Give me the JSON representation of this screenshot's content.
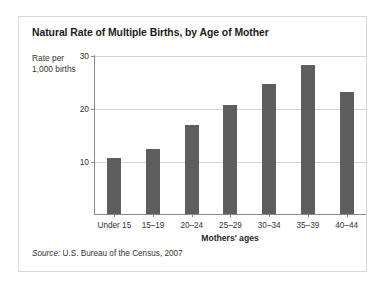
{
  "figure": {
    "title": "Natural Rate of Multiple Births, by Age of Mother",
    "source_prefix": "Source:",
    "source_text": " U.S. Bureau of the Census, 2007",
    "ylabel_line1": "Rate per",
    "ylabel_line2": "1,000 births",
    "xlabel": "Mothers' ages",
    "bar_color": "#5e5e5e",
    "grid_color": "#d5d5d5",
    "axis_color": "#8a8a8a",
    "frame_color": "#d8d8d8"
  },
  "chart_data": {
    "type": "bar",
    "title": "Natural Rate of Multiple Births, by Age of Mother",
    "xlabel": "Mothers' ages",
    "ylabel": "Rate per 1,000 births",
    "categories": [
      "Under 15",
      "15–19",
      "20–24",
      "25–29",
      "30–34",
      "35–39",
      "40–44"
    ],
    "values": [
      10.6,
      12.3,
      16.8,
      20.6,
      24.6,
      28.1,
      23.1
    ],
    "ylim": [
      0,
      30
    ],
    "yticks": [
      10,
      20,
      30
    ],
    "ytick_labels": [
      "10",
      "20",
      "30"
    ],
    "grid": true,
    "legend": false,
    "annotations": [
      "Source: U.S. Bureau of the Census, 2007"
    ]
  }
}
